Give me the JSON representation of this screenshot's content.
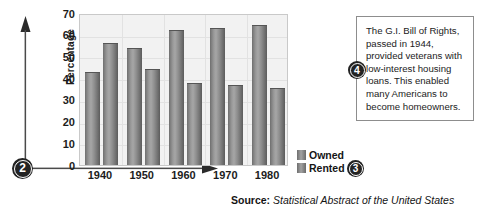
{
  "chart_data": {
    "type": "bar",
    "title": "",
    "xlabel": "",
    "ylabel": "Percentage",
    "categories": [
      "1940",
      "1950",
      "1960",
      "1970",
      "1980"
    ],
    "series": [
      {
        "name": "Owned",
        "values": [
          43,
          54,
          62,
          63,
          64.5
        ]
      },
      {
        "name": "Rented",
        "values": [
          56,
          44,
          38,
          37,
          35.5
        ]
      }
    ],
    "ylim": [
      0,
      70
    ],
    "yticks": [
      0,
      10,
      20,
      30,
      40,
      50,
      60,
      70
    ],
    "grid": true,
    "legend_position": "right-bottom"
  },
  "legend": {
    "items": [
      {
        "label": "Owned",
        "swatch": "legend-swatch-owned"
      },
      {
        "label": "Rented",
        "swatch": "legend-swatch-rented"
      }
    ]
  },
  "markers": {
    "axes_marker": "2",
    "legend_marker": "3",
    "callout_marker": "4"
  },
  "callout": {
    "text": "The G.I. Bill of Rights, passed in 1944, provided veterans with low-interest housing loans. This enabled many Americans to become homeowners."
  },
  "source": {
    "label": "Source:",
    "title": "Statistical Abstract of the United States"
  },
  "icons": {
    "y_axis_arrow": "up-arrow-icon",
    "x_axis_arrow": "right-arrow-icon"
  },
  "colors": {
    "bar_dark": "#6e6e6e",
    "bar_light": "#a6a6a6",
    "plot_background": "#f2f2f2",
    "gridline": "#e2e2e2",
    "marker_fill": "#232323",
    "text": "#1c1c1c"
  }
}
